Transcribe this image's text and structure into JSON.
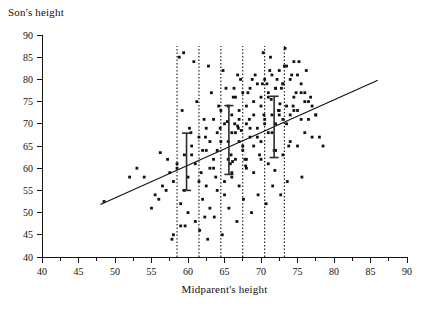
{
  "chart_data": {
    "type": "scatter",
    "title": "",
    "xlabel": "Midparent's height",
    "ylabel": "Son's height",
    "xlim": [
      40,
      90
    ],
    "ylim": [
      40,
      90
    ],
    "xticks": [
      40,
      45,
      50,
      55,
      60,
      65,
      70,
      75,
      80,
      85,
      90
    ],
    "yticks": [
      40,
      45,
      50,
      55,
      60,
      65,
      70,
      75,
      80,
      85,
      90
    ],
    "xtick_labels": [
      "40",
      "45",
      "50",
      "55",
      "60",
      "65",
      "70",
      "75",
      "80",
      "85",
      "90"
    ],
    "ytick_labels": [
      "40",
      "45",
      "50",
      "55",
      "60",
      "65",
      "70",
      "75",
      "80",
      "85",
      "90"
    ],
    "minor_tick_step": 2.5,
    "grid": false,
    "legend": "none",
    "regression_line": {
      "x": [
        48.0,
        86.0
      ],
      "y": [
        51.8,
        79.8
      ],
      "slope": 0.737,
      "intercept": 16.4
    },
    "vertical_strips": [
      {
        "x_min": 58.5,
        "x_max": 61.5
      },
      {
        "x_min": 64.5,
        "x_max": 67.5
      },
      {
        "x_min": 70.5,
        "x_max": 73.2
      }
    ],
    "error_bars": [
      {
        "x": 59.8,
        "mean": 63.5,
        "low": 55.0,
        "high": 67.9
      },
      {
        "x": 65.6,
        "mean": 67.0,
        "low": 58.6,
        "high": 74.1
      },
      {
        "x": 71.8,
        "mean": 70.9,
        "low": 62.4,
        "high": 76.2
      }
    ],
    "x": [
      57.8,
      62.3,
      62.5,
      63.0,
      63.5,
      64.0,
      65.0,
      65.5,
      66.0,
      66.0,
      66.5,
      67.0,
      67.0,
      67.5,
      68.0,
      68.0,
      68.5,
      69.0,
      69.0,
      69.5,
      70.0,
      70.0,
      70.5,
      71.0,
      71.0,
      71.5,
      72.0,
      72.0,
      72.5,
      73.0,
      73.0,
      73.5,
      74.0,
      74.5,
      75.0,
      75.5,
      76.0,
      76.5,
      77.0,
      77.5,
      55.0,
      56.0,
      57.0,
      58.0,
      58.5,
      59.0,
      59.5,
      60.0,
      60.5,
      61.0,
      61.5,
      62.0,
      62.5,
      63.0,
      63.5,
      64.0,
      64.5,
      65.0,
      65.5,
      66.0,
      66.5,
      67.0,
      67.5,
      68.0,
      68.5,
      69.0,
      69.5,
      70.0,
      70.5,
      71.0,
      71.5,
      72.0,
      72.5,
      73.0,
      73.5,
      74.0,
      74.5,
      75.0,
      75.5,
      76.0,
      54.0,
      55.5,
      56.5,
      57.5,
      58.5,
      59.5,
      60.5,
      61.5,
      62.5,
      63.5,
      64.5,
      65.5,
      66.5,
      67.5,
      68.5,
      69.5,
      70.5,
      71.5,
      72.5,
      73.5,
      74.5,
      75.5,
      76.5,
      77.5,
      78.0,
      58.0,
      59.0,
      60.0,
      61.0,
      62.0,
      63.0,
      64.0,
      65.0,
      66.0,
      67.0,
      68.0,
      69.0,
      70.0,
      71.0,
      72.0,
      73.0,
      74.0,
      75.0,
      76.0,
      77.0,
      59.2,
      60.2,
      61.2,
      62.2,
      63.2,
      64.2,
      65.2,
      66.2,
      67.2,
      68.2,
      69.2,
      70.2,
      71.2,
      72.2,
      73.2,
      74.2,
      75.2,
      76.2,
      58.8,
      60.8,
      62.8,
      64.8,
      66.8,
      68.8,
      70.8,
      72.8,
      74.8,
      76.8,
      60.4,
      62.4,
      64.4,
      66.4,
      68.4,
      70.4,
      72.4,
      74.4,
      61.8,
      63.8,
      65.8,
      67.8,
      69.8,
      71.8,
      73.8,
      59.6,
      61.6,
      63.6,
      65.6,
      67.6,
      69.6,
      71.6,
      73.6,
      75.6,
      57.2,
      62.7,
      64.7,
      66.7,
      68.7,
      70.7,
      72.7,
      48.5,
      52.0,
      53.0,
      56.2,
      66.3,
      66.8,
      70.3,
      71.3,
      73.3,
      78.5,
      59.4,
      65.4,
      66.9,
      67.3,
      71.4,
      72.6,
      65.9,
      66.1,
      67.9,
      71.9
    ],
    "y": [
      44.0,
      49.0,
      56.0,
      60.0,
      62.0,
      64.0,
      57.0,
      66.0,
      59.0,
      68.0,
      62.0,
      66.0,
      71.0,
      64.0,
      62.0,
      70.0,
      67.0,
      65.0,
      72.0,
      69.0,
      66.0,
      74.0,
      71.0,
      68.0,
      76.0,
      72.0,
      70.0,
      78.0,
      73.0,
      71.0,
      79.0,
      74.0,
      72.0,
      76.0,
      73.0,
      77.0,
      75.0,
      71.0,
      74.0,
      72.0,
      51.0,
      53.0,
      55.0,
      57.0,
      60.0,
      52.0,
      63.0,
      58.0,
      65.0,
      61.0,
      67.0,
      64.0,
      69.0,
      66.0,
      71.0,
      68.0,
      73.0,
      70.0,
      74.0,
      72.0,
      76.0,
      73.0,
      77.0,
      74.0,
      78.0,
      75.0,
      79.0,
      76.0,
      80.0,
      77.0,
      81.0,
      78.0,
      82.0,
      79.0,
      83.0,
      80.0,
      84.0,
      81.0,
      79.0,
      77.0,
      58.0,
      54.0,
      56.0,
      59.0,
      61.0,
      55.0,
      63.0,
      57.0,
      64.0,
      60.0,
      66.0,
      62.0,
      68.0,
      65.0,
      69.0,
      67.0,
      70.0,
      68.0,
      72.0,
      70.0,
      73.0,
      71.0,
      75.0,
      72.0,
      67.0,
      45.0,
      47.0,
      50.0,
      48.0,
      53.0,
      51.0,
      55.0,
      54.0,
      58.0,
      56.0,
      60.0,
      59.0,
      62.0,
      61.0,
      64.0,
      63.0,
      66.0,
      65.0,
      68.0,
      67.0,
      73.0,
      69.0,
      75.0,
      71.0,
      77.0,
      74.0,
      78.0,
      76.0,
      80.0,
      77.0,
      81.0,
      79.0,
      82.0,
      80.0,
      83.0,
      81.0,
      84.0,
      82.0,
      85.0,
      84.0,
      83.0,
      82.0,
      81.0,
      80.0,
      79.0,
      78.0,
      77.0,
      76.0,
      68.0,
      67.0,
      69.0,
      70.0,
      71.0,
      72.0,
      73.0,
      74.0,
      59.0,
      58.0,
      61.0,
      62.0,
      63.0,
      64.0,
      65.0,
      47.0,
      46.0,
      49.0,
      51.0,
      53.0,
      54.0,
      56.0,
      57.0,
      58.0,
      62.0,
      44.0,
      45.0,
      48.0,
      50.0,
      52.0,
      54.0,
      52.5,
      58.0,
      60.0,
      63.5,
      78.0,
      69.5,
      86.0,
      85.0,
      87.0,
      65.0,
      86.0,
      70.5,
      69.0,
      68.5,
      75.5,
      74.5,
      63.0,
      61.5,
      60.5,
      59.5
    ]
  }
}
